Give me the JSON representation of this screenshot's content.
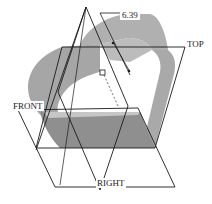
{
  "viewport": {
    "background": "#ffffff",
    "model_color": "#a9a9a9",
    "model_dark_color": "#8c8c8c",
    "line_color": "#1a1a1a"
  },
  "datum_planes": {
    "top": {
      "label": "TOP"
    },
    "front": {
      "label": "FRONT"
    },
    "right": {
      "label": "RIGHT"
    }
  },
  "dimension": {
    "value": "6.39"
  }
}
